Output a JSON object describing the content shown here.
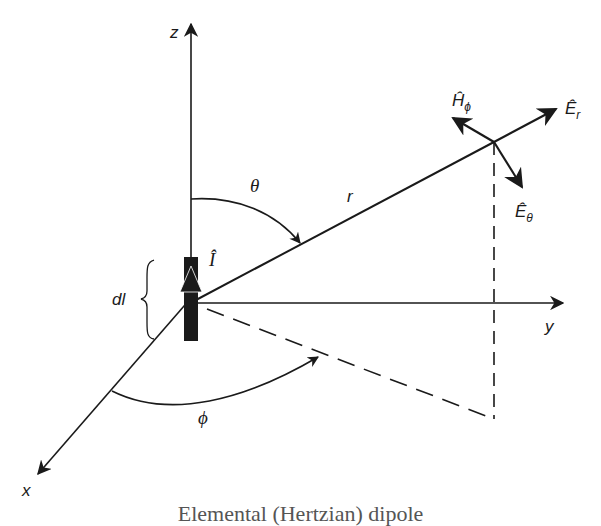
{
  "figure": {
    "labels": {
      "z_axis": "z",
      "y_axis": "y",
      "x_axis": "x",
      "theta": "θ",
      "phi": "ϕ",
      "r": "r",
      "dl": "dl",
      "current": "Î",
      "E_r": "Ê",
      "E_r_sub": "r",
      "E_theta": "Ê",
      "E_theta_sub": "θ",
      "H_phi": "Ĥ",
      "H_phi_sub": "ϕ"
    },
    "caption": "Elemental (Hertzian) dipole",
    "colors": {
      "ink": "#1a1a1a",
      "background": "#ffffff"
    }
  }
}
